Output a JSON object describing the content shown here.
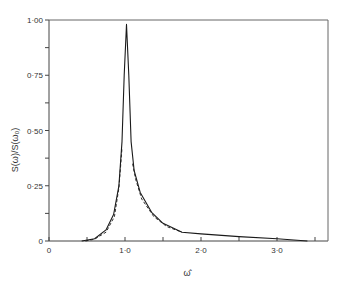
{
  "chart_data": {
    "type": "line",
    "title": "",
    "xlabel": "ω̂",
    "ylabel": "S(ω)/S(ω₀)",
    "xlim": [
      0,
      3.6
    ],
    "ylim": [
      0,
      1.0
    ],
    "grid": false,
    "x_ticks": [
      {
        "value": 0,
        "label": "0"
      },
      {
        "value": 0.5,
        "label": ""
      },
      {
        "value": 1.0,
        "label": "1·0"
      },
      {
        "value": 1.5,
        "label": ""
      },
      {
        "value": 2.0,
        "label": "2·0"
      },
      {
        "value": 2.5,
        "label": ""
      },
      {
        "value": 3.0,
        "label": "3·0"
      },
      {
        "value": 3.5,
        "label": ""
      }
    ],
    "y_ticks": [
      {
        "value": 0,
        "label": "0"
      },
      {
        "value": 0.125,
        "label": ""
      },
      {
        "value": 0.25,
        "label": "0·25"
      },
      {
        "value": 0.375,
        "label": ""
      },
      {
        "value": 0.5,
        "label": "0·50"
      },
      {
        "value": 0.625,
        "label": ""
      },
      {
        "value": 0.75,
        "label": "0·75"
      },
      {
        "value": 0.875,
        "label": ""
      },
      {
        "value": 1.0,
        "label": "1·00"
      }
    ],
    "series": [
      {
        "name": "solid",
        "style": "solid",
        "x": [
          0.43,
          0.6,
          0.75,
          0.85,
          0.92,
          0.96,
          0.99,
          1.02,
          1.05,
          1.08,
          1.12,
          1.2,
          1.35,
          1.5,
          1.75,
          2.0,
          2.5,
          3.0,
          3.4
        ],
        "y": [
          0.0,
          0.01,
          0.05,
          0.12,
          0.25,
          0.45,
          0.75,
          0.98,
          0.75,
          0.45,
          0.32,
          0.22,
          0.13,
          0.08,
          0.04,
          0.032,
          0.02,
          0.01,
          0.0
        ]
      },
      {
        "name": "dashed",
        "style": "dashed",
        "x": [
          0.48,
          0.6,
          0.75,
          0.86,
          0.92,
          0.96,
          1.1,
          1.14,
          1.22,
          1.38,
          1.55,
          1.75
        ],
        "y": [
          0.0,
          0.008,
          0.04,
          0.11,
          0.24,
          0.42,
          0.35,
          0.28,
          0.19,
          0.11,
          0.065,
          0.04
        ]
      }
    ]
  }
}
